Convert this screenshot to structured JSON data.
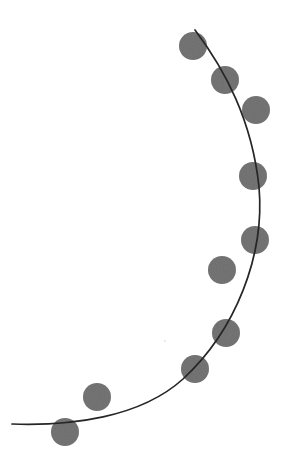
{
  "canvas": {
    "width": 281,
    "height": 476,
    "background_color": "#ffffff"
  },
  "chart_data": {
    "type": "scatter",
    "title": "",
    "subtitle": "",
    "xlabel": "",
    "ylabel": "",
    "xlim": [
      0,
      281
    ],
    "ylim": [
      0,
      476
    ],
    "grid": false,
    "legend": null,
    "axes_visible": false,
    "tick_labels": {
      "x": [],
      "y": []
    },
    "annotations": [],
    "series": [
      {
        "name": "markers",
        "type": "scatter",
        "marker": "circle",
        "marker_color": "#767676",
        "marker_radius": 14,
        "points": [
          {
            "x": 193,
            "y": 46
          },
          {
            "x": 225,
            "y": 80
          },
          {
            "x": 256,
            "y": 110
          },
          {
            "x": 253,
            "y": 176
          },
          {
            "x": 255,
            "y": 240
          },
          {
            "x": 222,
            "y": 270
          },
          {
            "x": 226,
            "y": 333
          },
          {
            "x": 195,
            "y": 369
          },
          {
            "x": 97,
            "y": 397
          },
          {
            "x": 65,
            "y": 432
          }
        ]
      },
      {
        "name": "curve",
        "type": "line",
        "line_color": "#262626",
        "line_width": 1.7,
        "path": "M 195 30 C 225 70, 252 120, 259 187 C 265 255, 236 330, 183 379 C 140 418, 70 426, 12 424"
      }
    ],
    "artifacts": [
      {
        "name": "speck",
        "x": 165,
        "y": 341,
        "radius": 1.1,
        "color": "#e4e4e4"
      }
    ]
  },
  "colors": {
    "marker_gray": "#767676",
    "marker_gray_dark": "#6d6d6d",
    "curve_dark": "#262626",
    "background": "#ffffff"
  }
}
